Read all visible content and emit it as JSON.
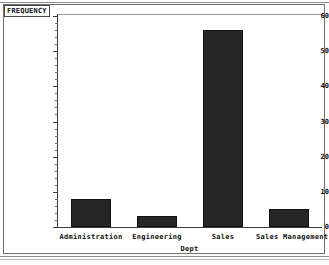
{
  "figure": {
    "frequency_label": "FREQUENCY"
  },
  "chart_data": {
    "type": "bar",
    "title": "FREQUENCY",
    "xlabel": "Dept",
    "ylabel": "FREQUENCY",
    "categories": [
      "Administration",
      "Engineering",
      "Sales",
      "Sales Management"
    ],
    "values": [
      8,
      3,
      56,
      5
    ],
    "ylim": [
      0,
      60
    ],
    "yticks": [
      0,
      10,
      20,
      30,
      40,
      50,
      60
    ],
    "ytick_labels": [
      "0",
      "10",
      "20",
      "30",
      "40",
      "50",
      "60"
    ],
    "grid": false,
    "legend": "none",
    "bar_color": "#262626",
    "axis_color": "#3c3c3c",
    "background_color": "#ffffff"
  }
}
